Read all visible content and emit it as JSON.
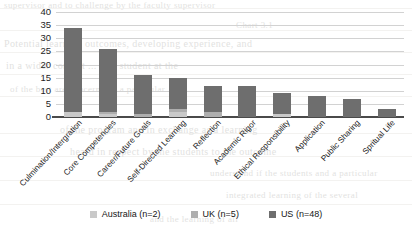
{
  "chart_data": {
    "type": "bar",
    "subtype": "stacked-bar",
    "title": "",
    "xlabel": "",
    "ylabel": "",
    "ylim": [
      0,
      40
    ],
    "yticks": [
      0,
      5,
      10,
      15,
      20,
      25,
      30,
      35,
      40
    ],
    "grid": true,
    "legend_position": "bottom",
    "categories": [
      "Culmination/Intergration",
      "Core Competencies",
      "Career/Future Goals",
      "Self-Directed Learning",
      "Reflection",
      "Academic Rigor",
      "Ethical Responsibility",
      "Application",
      "Public Sharing",
      "Spritual Life"
    ],
    "series": [
      {
        "name": "Australia (n=2)",
        "color": "#c9c9c9",
        "values": [
          2,
          1,
          0,
          2,
          0,
          0,
          1,
          0,
          0,
          0
        ]
      },
      {
        "name": "UK (n=5)",
        "color": "#aeaeae",
        "values": [
          0,
          1,
          1,
          1,
          2,
          0,
          0,
          0,
          0,
          0
        ]
      },
      {
        "name": "US (n=48)",
        "color": "#6e6e6e",
        "values": [
          32,
          24,
          15,
          12,
          10,
          12,
          8,
          8,
          7,
          3
        ]
      }
    ],
    "totals": [
      34,
      26,
      16,
      15,
      12,
      12,
      9,
      8,
      7,
      3
    ]
  },
  "legend": {
    "items": [
      {
        "label": "Australia (n=2)",
        "color": "#c9c9c9"
      },
      {
        "label": "UK (n=5)",
        "color": "#aeaeae"
      },
      {
        "label": "US (n=48)",
        "color": "#6e6e6e"
      }
    ]
  },
  "background_text": {
    "lines": [
      "supervisor and to challenge by the faculty supervisor",
      "Chart 3.1",
      "Potential learning outcomes, developing experience, and",
      "in a wider context ... as a student at the",
      "of the best are concerns on a particular",
      "of the program and in exchange as a learning",
      "heard in respect by the students to the outcome",
      "understand if the students and a particular",
      "integrated learning of the several",
      "and the learning of all",
      "a student learning context, developing experience, and",
      "it to assist in a student learning"
    ]
  }
}
